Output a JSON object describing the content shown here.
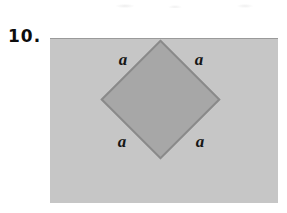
{
  "figure": {
    "problem_number": "10.",
    "shape": {
      "type": "rotated-square",
      "sides_equal": true
    },
    "side_labels": {
      "top_left": "a",
      "top_right": "a",
      "bottom_left": "a",
      "bottom_right": "a"
    },
    "colors": {
      "page_bg": "#ffffff",
      "panel_bg": "#c6c6c6",
      "panel_top_edge": "#9a9a9a",
      "diamond_fill": "#a7a7a7",
      "diamond_border": "#8a8a8a",
      "label_color": "#161616",
      "number_color": "#0d0d0d"
    }
  }
}
